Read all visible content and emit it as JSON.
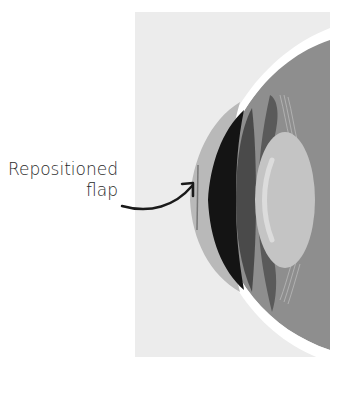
{
  "figure": {
    "annotation": {
      "line1": "Repositioned",
      "line2": "flap"
    },
    "colors": {
      "background_panel": "#ececec",
      "sclera_white": "#ffffff",
      "cornea_light": "#b9b9b9",
      "iris_dark": "#141414",
      "iris_mid": "#4a4a4a",
      "ciliary": "#5a5a5a",
      "lens_light": "#c4c4c4",
      "vitreous": "#8e8e8e",
      "arrow": "#1a1a1a"
    }
  }
}
